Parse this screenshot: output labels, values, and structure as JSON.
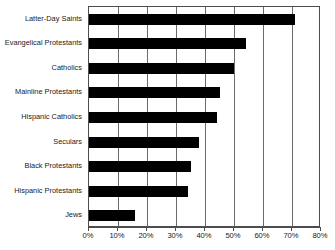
{
  "chart_data": {
    "type": "bar",
    "orientation": "horizontal",
    "title": "",
    "subtitle": "",
    "xlabel": "",
    "ylabel": "",
    "xlim": [
      0,
      80
    ],
    "xtick_step": 10,
    "grid": true,
    "legend": null,
    "bar_color": "#000000",
    "categories": [
      "Latter-Day Saints",
      "Evangelical Protestants",
      "Catholics",
      "Mainline Protestants",
      "Hispanic Catholics",
      "Seculars",
      "Black Protestants",
      "Hispanic Protestants",
      "Jews"
    ],
    "values": [
      71,
      54,
      50,
      45,
      44,
      38,
      35,
      34,
      16
    ],
    "tick_labels": [
      "0%",
      "10%",
      "20%",
      "30%",
      "40%",
      "50%",
      "60%",
      "70%",
      "80%"
    ],
    "tick_values": [
      0,
      10,
      20,
      30,
      40,
      50,
      60,
      70,
      80
    ]
  }
}
